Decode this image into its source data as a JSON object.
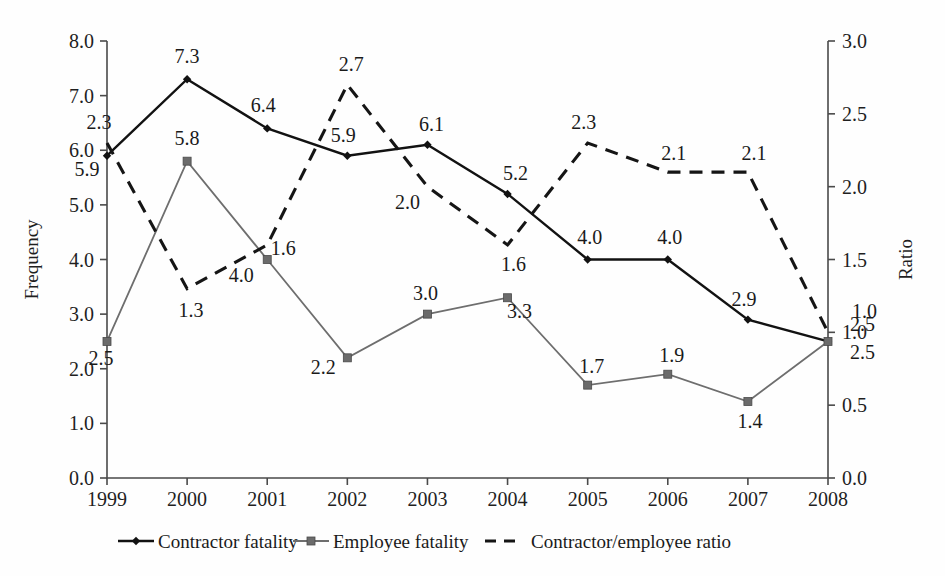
{
  "chart_data": {
    "type": "line",
    "title": "",
    "xlabel": "",
    "ylabel": "Frequency",
    "y2label": "Ratio",
    "categories": [
      "1999",
      "2000",
      "2001",
      "2002",
      "2003",
      "2004",
      "2005",
      "2006",
      "2007",
      "2008"
    ],
    "ylim": [
      0.0,
      8.0
    ],
    "yticks": [
      "0.0",
      "1.0",
      "2.0",
      "3.0",
      "4.0",
      "5.0",
      "6.0",
      "7.0",
      "8.0"
    ],
    "y2lim": [
      0.0,
      3.0
    ],
    "y2ticks": [
      "0.0",
      "0.5",
      "1.0",
      "1.5",
      "2.0",
      "2.5",
      "3.0"
    ],
    "grid": false,
    "legend_position": "bottom",
    "series": [
      {
        "name": "Contractor fatality",
        "axis": "left",
        "marker": "diamond",
        "linestyle": "solid",
        "color": "#121212",
        "values": [
          5.9,
          7.3,
          6.4,
          5.9,
          6.1,
          5.2,
          4.0,
          4.0,
          2.9,
          2.5
        ],
        "labels": [
          "5.9",
          "7.3",
          "6.4",
          "5.9",
          "6.1",
          "5.2",
          "4.0",
          "4.0",
          "2.9",
          "2.5"
        ]
      },
      {
        "name": "Employee fatality",
        "axis": "left",
        "marker": "square",
        "linestyle": "solid",
        "color": "#6e6e6e",
        "values": [
          2.5,
          5.8,
          4.0,
          2.2,
          3.0,
          3.3,
          1.7,
          1.9,
          1.4,
          2.5
        ],
        "labels": [
          "2.5",
          "5.8",
          "4.0",
          "2.2",
          "3.0",
          "3.3",
          "1.7",
          "1.9",
          "1.4",
          "2.5"
        ]
      },
      {
        "name": "Contractor/employee ratio",
        "axis": "right",
        "marker": "none",
        "linestyle": "dashed",
        "color": "#151515",
        "values": [
          2.3,
          1.3,
          1.6,
          2.7,
          2.0,
          1.6,
          2.3,
          2.1,
          2.1,
          1.0
        ],
        "labels": [
          "2.3",
          "1.3",
          "1.6",
          "2.7",
          "2.0",
          "1.6",
          "2.3",
          "2.1",
          "2.1",
          "1.0"
        ]
      }
    ]
  },
  "axes": {
    "left_title": "Frequency",
    "right_title": "Ratio",
    "left_ticks": [
      "8.0",
      "7.0",
      "6.0",
      "5.0",
      "4.0",
      "3.0",
      "2.0",
      "1.0",
      "0.0"
    ],
    "right_ticks": [
      "3.0",
      "2.5",
      "2.0",
      "1.5",
      "1.0",
      "0.5",
      "0.0"
    ],
    "x_ticks": [
      "1999",
      "2000",
      "2001",
      "2002",
      "2003",
      "2004",
      "2005",
      "2006",
      "2007",
      "2008"
    ]
  },
  "legend": {
    "items": [
      {
        "label": "Contractor fatality",
        "marker": "diamond",
        "linestyle": "solid",
        "color": "#121212"
      },
      {
        "label": "Employee fatality",
        "marker": "square",
        "linestyle": "solid",
        "color": "#6e6e6e"
      },
      {
        "label": "Contractor/employee ratio",
        "marker": "none",
        "linestyle": "dashed",
        "color": "#151515"
      }
    ]
  },
  "data_labels": {
    "contractor": [
      "5.9",
      "7.3",
      "6.4",
      "5.9",
      "6.1",
      "5.2",
      "4.0",
      "4.0",
      "2.9",
      "2.5"
    ],
    "employee": [
      "2.5",
      "5.8",
      "4.0",
      "2.2",
      "3.0",
      "3.3",
      "1.7",
      "1.9",
      "1.4",
      "2.5"
    ],
    "ratio": [
      "2.3",
      "1.3",
      "1.6",
      "2.7",
      "2.0",
      "1.6",
      "2.3",
      "2.1",
      "2.1",
      "1.0"
    ]
  }
}
